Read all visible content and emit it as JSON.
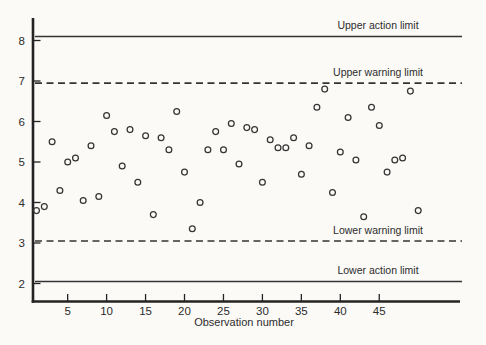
{
  "chart_data": {
    "type": "scatter",
    "title": "",
    "xlabel": "Observation number",
    "ylabel": "",
    "grid": false,
    "legend": null,
    "marker": "open-circle",
    "xlim": [
      0.55,
      55.4
    ],
    "ylim": [
      1.56,
      8.56
    ],
    "x_ticks": [
      5,
      10,
      15,
      20,
      25,
      30,
      35,
      40,
      45
    ],
    "x_tick_labels": [
      "5",
      "10",
      "15",
      "20",
      "25",
      "30",
      "35",
      "40",
      "45"
    ],
    "y_ticks": [
      2,
      3,
      4,
      5,
      6,
      7,
      8
    ],
    "y_tick_labels": [
      "2",
      "3",
      "4",
      "5",
      "6",
      "7",
      "8"
    ],
    "x": [
      1,
      2,
      3,
      4,
      5,
      6,
      7,
      8,
      9,
      10,
      11,
      12,
      13,
      14,
      15,
      16,
      17,
      18,
      19,
      20,
      21,
      22,
      23,
      24,
      25,
      26,
      27,
      28,
      29,
      30,
      31,
      32,
      33,
      34,
      35,
      36,
      37,
      38,
      39,
      40,
      41,
      42,
      43,
      44,
      45,
      46,
      47,
      48,
      49,
      50
    ],
    "y": [
      3.8,
      3.9,
      5.5,
      4.3,
      5.0,
      5.1,
      4.05,
      5.4,
      4.15,
      6.15,
      5.75,
      4.9,
      5.8,
      4.5,
      5.65,
      3.7,
      5.6,
      5.3,
      6.25,
      4.75,
      3.35,
      4.0,
      5.3,
      5.75,
      5.3,
      5.95,
      4.95,
      5.85,
      5.8,
      4.5,
      5.55,
      5.35,
      5.35,
      5.6,
      4.7,
      5.4,
      6.35,
      6.8,
      4.25,
      5.25,
      6.1,
      5.05,
      3.65,
      6.35,
      5.9,
      4.75,
      5.05,
      5.1,
      6.75,
      3.8
    ],
    "limit_lines": [
      {
        "name": "upper-action-limit",
        "label": "Upper action limit",
        "value": 8.1,
        "style": "solid"
      },
      {
        "name": "upper-warning-limit",
        "label": "Upper warning limit",
        "value": 6.95,
        "style": "dashed"
      },
      {
        "name": "lower-warning-limit",
        "label": "Lower warning limit",
        "value": 3.05,
        "style": "dashed"
      },
      {
        "name": "lower-action-limit",
        "label": "Lower action limit",
        "value": 2.05,
        "style": "solid"
      }
    ],
    "colors": {
      "ink": "#343434",
      "axis": "#232323",
      "text": "#2c2c2c",
      "background": "#fbfaf7"
    }
  }
}
